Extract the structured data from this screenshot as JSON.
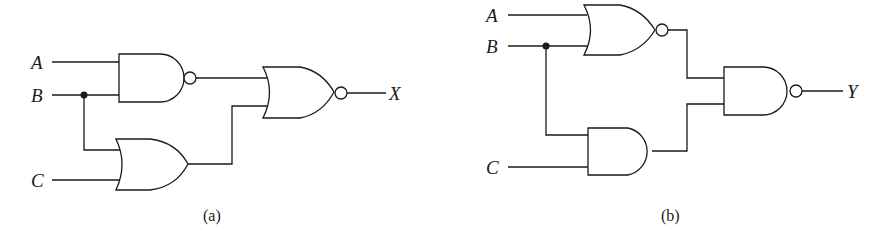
{
  "figure": {
    "circuits": [
      {
        "id": "a",
        "caption": "(a)",
        "inputs": [
          "A",
          "B",
          "C"
        ],
        "output": "X",
        "gates": [
          {
            "type": "NAND",
            "inputs": [
              "A",
              "B"
            ]
          },
          {
            "type": "OR",
            "inputs": [
              "B",
              "C"
            ]
          },
          {
            "type": "NOR",
            "inputs": [
              "NAND output",
              "OR output"
            ],
            "output": "X"
          }
        ]
      },
      {
        "id": "b",
        "caption": "(b)",
        "inputs": [
          "A",
          "B",
          "C"
        ],
        "output": "Y",
        "gates": [
          {
            "type": "NOR",
            "inputs": [
              "A",
              "B"
            ]
          },
          {
            "type": "AND",
            "inputs": [
              "B",
              "C"
            ]
          },
          {
            "type": "NAND",
            "inputs": [
              "NOR output",
              "AND output"
            ],
            "output": "Y"
          }
        ]
      }
    ]
  },
  "labels": {
    "a": {
      "A": "A",
      "B": "B",
      "C": "C",
      "out": "X",
      "caption": "(a)"
    },
    "b": {
      "A": "A",
      "B": "B",
      "C": "C",
      "out": "Y",
      "caption": "(b)"
    }
  }
}
